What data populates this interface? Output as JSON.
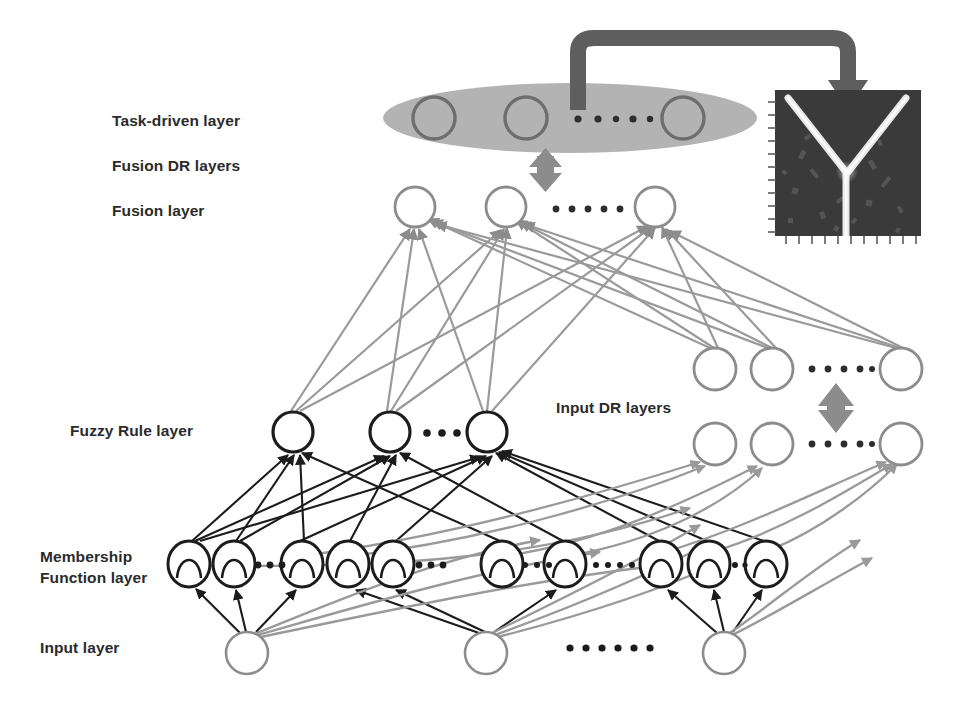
{
  "figure": {
    "type": "neural-network-architecture-diagram"
  },
  "labels": {
    "task_driven_layer": "Task-driven layer",
    "fusion_dr_layers": "Fusion  DR layers",
    "fusion_layer": "Fusion  layer",
    "fuzzy_rule_layer": "Fuzzy Rule layer",
    "membership_function_layer_line1": "Membership",
    "membership_function_layer_line2": "Function layer",
    "input_layer": "Input layer",
    "input_dr_layers": "Input DR  layers"
  },
  "colors": {
    "ink_black": "#1c1c1c",
    "ink_gray": "#8c8c8c",
    "arrow_gray": "#808080",
    "ellipse_fill": "#b3b3b3",
    "ellipse_node_stroke": "#6e6e6e",
    "thick_connector": "#5e5e5e",
    "label_text": "#2b2b2b",
    "thumbnail_background": "#3a3a3a",
    "thumbnail_structure": "#e8e8e8"
  },
  "layers": {
    "task_driven": {
      "name": "task-driven-layer",
      "shape": "ellipse",
      "ellipse": {
        "cx": 570,
        "cy": 118,
        "rx": 187,
        "ry": 35
      },
      "node_count": 3,
      "nodes": [
        {
          "cx": 434,
          "cy": 118,
          "r": 21
        },
        {
          "cx": 526,
          "cy": 118,
          "r": 21
        },
        {
          "cx": 683,
          "cy": 118,
          "r": 21
        }
      ],
      "ellipsis": {
        "x": 575,
        "y": 119,
        "dots": 6
      }
    },
    "fusion": {
      "name": "fusion-layer",
      "node_count": 3,
      "nodes": [
        {
          "cx": 415,
          "cy": 207,
          "r": 20
        },
        {
          "cx": 506,
          "cy": 207,
          "r": 20
        },
        {
          "cx": 655,
          "cy": 207,
          "r": 20
        }
      ],
      "ellipsis": {
        "x": 556,
        "y": 209,
        "dots": 6
      }
    },
    "input_dr_upper": {
      "name": "input-dr-upper-row",
      "node_count": 3,
      "nodes": [
        {
          "cx": 715,
          "cy": 369,
          "r": 21
        },
        {
          "cx": 772,
          "cy": 369,
          "r": 21
        },
        {
          "cx": 901,
          "cy": 369,
          "r": 21
        }
      ],
      "ellipsis": {
        "x": 812,
        "y": 369,
        "dots": 5
      }
    },
    "input_dr_lower": {
      "name": "input-dr-lower-row",
      "node_count": 3,
      "nodes": [
        {
          "cx": 715,
          "cy": 444,
          "r": 21
        },
        {
          "cx": 772,
          "cy": 444,
          "r": 21
        },
        {
          "cx": 901,
          "cy": 444,
          "r": 21
        }
      ],
      "ellipsis": {
        "x": 812,
        "y": 444,
        "dots": 5
      }
    },
    "fuzzy_rule": {
      "name": "fuzzy-rule-layer",
      "node_count": 3,
      "nodes": [
        {
          "cx": 293,
          "cy": 432,
          "r": 20
        },
        {
          "cx": 390,
          "cy": 432,
          "r": 20
        },
        {
          "cx": 487,
          "cy": 432,
          "r": 20
        }
      ],
      "ellipsis": {
        "x": 432,
        "y": 433,
        "dots": 3
      }
    },
    "membership": {
      "name": "membership-function-layer",
      "node_count": 10,
      "nodes": [
        {
          "cx": 189,
          "cy": 564,
          "rx": 21,
          "ry": 23
        },
        {
          "cx": 234,
          "cy": 564,
          "rx": 21,
          "ry": 23
        },
        {
          "cx": 302,
          "cy": 564,
          "rx": 21,
          "ry": 23
        },
        {
          "cx": 348,
          "cy": 564,
          "rx": 21,
          "ry": 23
        },
        {
          "cx": 393,
          "cy": 564,
          "rx": 21,
          "ry": 23
        },
        {
          "cx": 502,
          "cy": 564,
          "rx": 21,
          "ry": 23
        },
        {
          "cx": 565,
          "cy": 564,
          "rx": 21,
          "ry": 23
        },
        {
          "cx": 661,
          "cy": 564,
          "rx": 21,
          "ry": 23
        },
        {
          "cx": 709,
          "cy": 564,
          "rx": 21,
          "ry": 23
        },
        {
          "cx": 766,
          "cy": 564,
          "rx": 21,
          "ry": 23
        }
      ],
      "ellipses_groups": [
        {
          "x": 258,
          "y": 565,
          "dots": 3
        },
        {
          "x": 424,
          "y": 565,
          "dots": 3
        },
        {
          "x": 525,
          "y": 565,
          "dots": 7
        },
        {
          "x": 733,
          "y": 565,
          "dots": 3
        }
      ],
      "glyph": "gaussian-bell-curve"
    },
    "input": {
      "name": "input-layer",
      "node_count": 3,
      "nodes": [
        {
          "cx": 247,
          "cy": 653,
          "r": 21
        },
        {
          "cx": 486,
          "cy": 653,
          "r": 21
        },
        {
          "cx": 724,
          "cy": 653,
          "r": 21
        }
      ],
      "ellipsis": {
        "x": 580,
        "y": 650,
        "dots": 6
      }
    }
  },
  "connectors": {
    "top_bracket": {
      "name": "task-driven-to-thumbnail-connector",
      "style": "thick-rounded-bracket-with-arrowhead",
      "from": "task-driven-layer",
      "to": "output-thumbnail",
      "color": "#5e5e5e"
    },
    "fusion_bidirectional": {
      "name": "fusion-dr-bidirectional-arrow",
      "style": "vertical-double-headed-arrow",
      "x": 545,
      "y_top": 152,
      "y_bottom": 186,
      "color": "#8c8c8c"
    },
    "input_dr_bidirectional": {
      "name": "input-dr-bidirectional-arrow",
      "style": "vertical-double-headed-arrow",
      "x": 836,
      "y_top": 386,
      "y_bottom": 428,
      "color": "#8c8c8c"
    }
  },
  "thumbnail": {
    "name": "output-thumbnail",
    "description": "dark microscopy image with bright Y-shaped junction structure",
    "x": 775,
    "y": 90,
    "width": 146,
    "height": 146,
    "has_axis_ticks": true,
    "tick_sides": [
      "left",
      "bottom"
    ]
  }
}
